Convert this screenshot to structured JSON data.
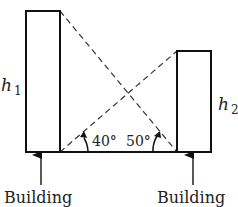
{
  "diagram": {
    "buildings": [
      {
        "id": "left",
        "height_label": "h",
        "height_sub": "1",
        "caption": "Building"
      },
      {
        "id": "right",
        "height_label": "h",
        "height_sub": "2",
        "caption": "Building"
      }
    ],
    "angles": [
      {
        "value": "40°",
        "from": "left building base"
      },
      {
        "value": "50°",
        "from": "right building base"
      }
    ]
  }
}
